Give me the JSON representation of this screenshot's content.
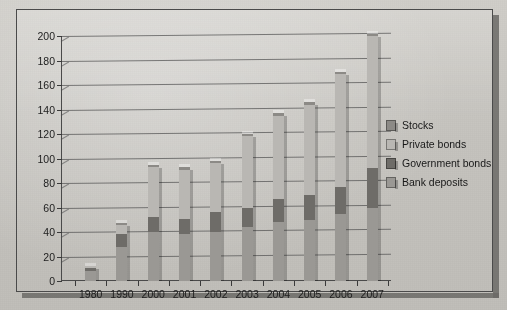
{
  "figure": {
    "background_color": "#c8c6c1",
    "frame_color": "#4a4a4a"
  },
  "chart_data": {
    "type": "bar",
    "stacked": true,
    "title": "",
    "subtitle": "",
    "xlabel": "",
    "ylabel": "",
    "grid": true,
    "legend_position": "right",
    "ylim": [
      0,
      200
    ],
    "ytick_step": 20,
    "yticks": [
      0,
      20,
      40,
      60,
      80,
      100,
      120,
      140,
      160,
      180,
      200
    ],
    "categories": [
      "1980",
      "1990",
      "2000",
      "2001",
      "2002",
      "2003",
      "2004",
      "2005",
      "2006",
      "2007"
    ],
    "series": [
      {
        "name": "Bank deposits",
        "color": "#9a9894",
        "values": [
          8,
          28,
          40,
          38,
          40,
          44,
          48,
          50,
          55,
          60
        ]
      },
      {
        "name": "Government bonds",
        "color": "#6e6c68",
        "values": [
          3,
          10,
          12,
          13,
          16,
          16,
          19,
          20,
          22,
          32
        ]
      },
      {
        "name": "Private bonds",
        "color": "#b9b7b3",
        "values": [
          1,
          8,
          41,
          40,
          40,
          58,
          68,
          74,
          92,
          108
        ]
      },
      {
        "name": "Stocks",
        "color": "#8c8a86",
        "values": [
          0,
          1,
          2,
          2,
          2,
          2,
          2,
          2,
          2,
          2
        ]
      }
    ],
    "totals": [
      12,
      47,
      95,
      93,
      98,
      120,
      137,
      146,
      171,
      202
    ]
  },
  "legend": {
    "items": [
      {
        "label": "Stocks",
        "color": "#8c8a86"
      },
      {
        "label": "Private bonds",
        "color": "#b9b7b3"
      },
      {
        "label": "Government bonds",
        "color": "#6e6c68"
      },
      {
        "label": "Bank deposits",
        "color": "#9a9894"
      }
    ]
  }
}
